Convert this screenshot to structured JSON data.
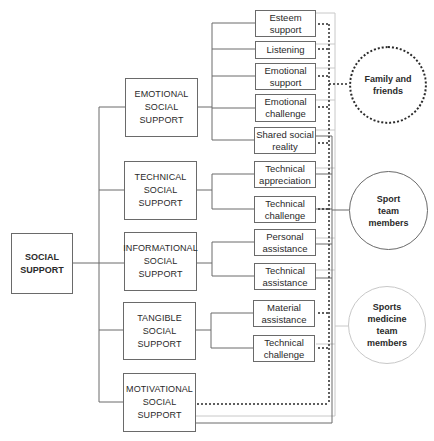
{
  "diagram": {
    "root": {
      "label": "SOCIAL\nSUPPORT"
    },
    "categories": [
      {
        "label": "EMOTIONAL\nSOCIAL\nSUPPORT"
      },
      {
        "label": "TECHNICAL\nSOCIAL\nSUPPORT"
      },
      {
        "label": "INFORMATIONAL\nSOCIAL\nSUPPORT"
      },
      {
        "label": "TANGIBLE\nSOCIAL\nSUPPORT"
      },
      {
        "label": "MOTIVATIONAL\nSOCIAL\nSUPPORT"
      }
    ],
    "leaves": [
      {
        "label": "Esteem\nsupport",
        "category": "EMOTIONAL SOCIAL SUPPORT"
      },
      {
        "label": "Listening",
        "category": "EMOTIONAL SOCIAL SUPPORT"
      },
      {
        "label": "Emotional\nsupport",
        "category": "EMOTIONAL SOCIAL SUPPORT"
      },
      {
        "label": "Emotional\nchallenge",
        "category": "EMOTIONAL SOCIAL SUPPORT"
      },
      {
        "label": "Shared social\nreality",
        "category": "EMOTIONAL SOCIAL SUPPORT"
      },
      {
        "label": "Technical\nappreciation",
        "category": "TECHNICAL SOCIAL SUPPORT"
      },
      {
        "label": "Technical\nchallenge",
        "category": "TECHNICAL SOCIAL SUPPORT"
      },
      {
        "label": "Personal\nassistance",
        "category": "INFORMATIONAL SOCIAL SUPPORT"
      },
      {
        "label": "Technical\nassistance",
        "category": "INFORMATIONAL SOCIAL SUPPORT"
      },
      {
        "label": "Material\nassistance",
        "category": "TANGIBLE SOCIAL SUPPORT"
      },
      {
        "label": "Technical\nchallenge",
        "category": "TANGIBLE SOCIAL SUPPORT"
      }
    ],
    "providers": [
      {
        "label": "Family and\nfriends",
        "line_style": "dotted",
        "color": "#2a2a2a"
      },
      {
        "label": "Sport\nteam\nmembers",
        "line_style": "solid-dark",
        "color": "#6a6a6a"
      },
      {
        "label": "Sports\nmedicine\nteam\nmembers",
        "line_style": "solid-light",
        "color": "#c8c8c8"
      }
    ]
  }
}
